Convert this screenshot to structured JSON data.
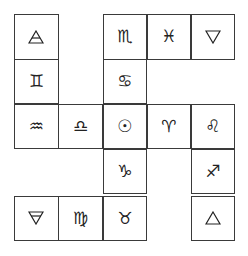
{
  "diagram": {
    "title": "",
    "rows": 5,
    "cols": 5,
    "cells": [
      {
        "row": 0,
        "col": 0,
        "symbol": "air",
        "glyph": "",
        "icon": "air-triangle-icon"
      },
      {
        "row": 0,
        "col": 2,
        "symbol": "scorpio",
        "glyph": "♏",
        "icon": "scorpio-icon"
      },
      {
        "row": 0,
        "col": 3,
        "symbol": "pisces",
        "glyph": "♓",
        "icon": "pisces-icon"
      },
      {
        "row": 0,
        "col": 4,
        "symbol": "water",
        "glyph": "",
        "icon": "water-triangle-icon"
      },
      {
        "row": 1,
        "col": 0,
        "symbol": "gemini",
        "glyph": "♊",
        "icon": "gemini-icon"
      },
      {
        "row": 1,
        "col": 2,
        "symbol": "cancer",
        "glyph": "♋",
        "icon": "cancer-icon"
      },
      {
        "row": 2,
        "col": 0,
        "symbol": "aquarius",
        "glyph": "♒",
        "icon": "aquarius-icon"
      },
      {
        "row": 2,
        "col": 1,
        "symbol": "libra",
        "glyph": "♎",
        "icon": "libra-icon"
      },
      {
        "row": 2,
        "col": 2,
        "symbol": "sun",
        "glyph": "☉",
        "icon": "sun-icon"
      },
      {
        "row": 2,
        "col": 3,
        "symbol": "aries",
        "glyph": "♈",
        "icon": "aries-icon"
      },
      {
        "row": 2,
        "col": 4,
        "symbol": "leo",
        "glyph": "♌",
        "icon": "leo-icon"
      },
      {
        "row": 3,
        "col": 2,
        "symbol": "capricorn",
        "glyph": "♑",
        "icon": "capricorn-icon"
      },
      {
        "row": 3,
        "col": 4,
        "symbol": "sagittarius",
        "glyph": "♐",
        "icon": "sagittarius-icon"
      },
      {
        "row": 4,
        "col": 0,
        "symbol": "earth",
        "glyph": "",
        "icon": "earth-triangle-icon"
      },
      {
        "row": 4,
        "col": 1,
        "symbol": "virgo",
        "glyph": "♍",
        "icon": "virgo-icon"
      },
      {
        "row": 4,
        "col": 2,
        "symbol": "taurus",
        "glyph": "♉",
        "icon": "taurus-icon"
      },
      {
        "row": 4,
        "col": 4,
        "symbol": "fire",
        "glyph": "",
        "icon": "fire-triangle-icon"
      }
    ]
  }
}
